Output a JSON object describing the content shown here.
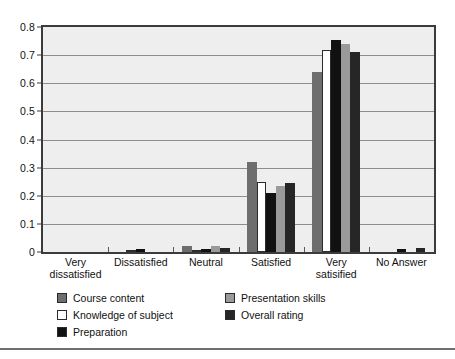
{
  "chart_data": {
    "type": "bar",
    "title": "",
    "xlabel": "",
    "ylabel": "",
    "ylim": [
      0,
      0.8
    ],
    "grid": true,
    "legend_position": "bottom-left",
    "categories": [
      "Very dissatisfied",
      "Dissatisfied",
      "Neutral",
      "Satisfied",
      "Very satisified",
      "No Answer"
    ],
    "category_lines": [
      [
        "Very",
        "dissatisfied"
      ],
      [
        "Dissatisfied"
      ],
      [
        "Neutral"
      ],
      [
        "Satisfied"
      ],
      [
        "Very",
        "satisified"
      ],
      [
        "No Answer"
      ]
    ],
    "ytick_labels": [
      "0",
      "0.1",
      "0.2",
      "0.3",
      "0.4",
      "0.5",
      "0.6",
      "0.7",
      "0.8"
    ],
    "ytick_values": [
      0,
      0.1,
      0.2,
      0.3,
      0.4,
      0.5,
      0.6,
      0.7,
      0.8
    ],
    "series": [
      {
        "name": "Course content",
        "color": "#6e6e6e",
        "values": [
          0,
          0,
          0.022,
          0.32,
          0.64,
          0
        ]
      },
      {
        "name": "Knowledge of subject",
        "color": "#ffffff",
        "values": [
          0,
          0.008,
          0.005,
          0.25,
          0.72,
          0
        ]
      },
      {
        "name": "Preparation",
        "color": "#111111",
        "values": [
          0,
          0.012,
          0.012,
          0.21,
          0.755,
          0.01
        ]
      },
      {
        "name": "Presentation skills",
        "color": "#9a9a9a",
        "values": [
          0,
          0,
          0.02,
          0.235,
          0.74,
          0
        ]
      },
      {
        "name": "Overall rating",
        "color": "#262626",
        "values": [
          0,
          0,
          0.015,
          0.245,
          0.71,
          0.015
        ]
      }
    ]
  },
  "legend": {
    "items": [
      {
        "label": "Course content",
        "color": "#6e6e6e"
      },
      {
        "label": "Knowledge of subject",
        "color": "#ffffff"
      },
      {
        "label": "Preparation",
        "color": "#111111"
      },
      {
        "label": "Presentation skills",
        "color": "#9a9a9a"
      },
      {
        "label": "Overall rating",
        "color": "#262626"
      }
    ]
  },
  "colors": {
    "plot_background": "#eeeeee",
    "frame": "#3b3b3b",
    "gridline": "#8d8d8d",
    "text": "#111111",
    "rule": "#6f6f6f"
  }
}
